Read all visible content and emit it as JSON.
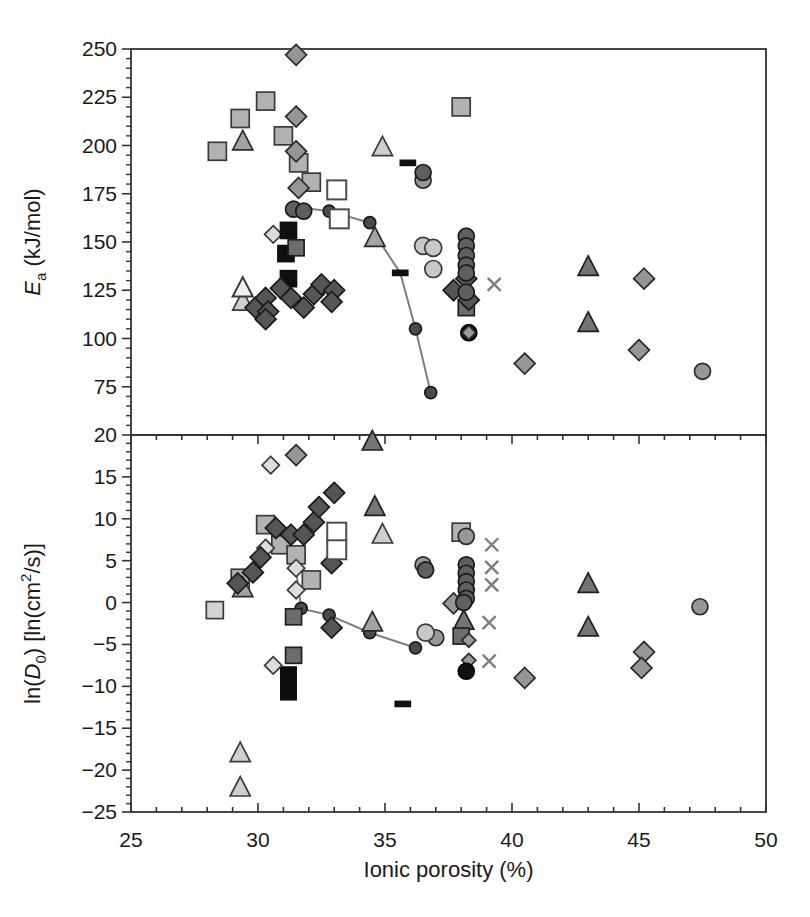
{
  "figure_bg": "#ffffff",
  "frame_color": "#333333",
  "tick_color": "#333333",
  "text_color": "#1a1a1a",
  "curve_color": "#7f7f7f",
  "layout": {
    "width": 810,
    "height": 917,
    "plot_left": 131,
    "plot_right": 766,
    "plot_top": 49,
    "plot_mid": 435,
    "plot_bottom": 812,
    "tick_font_px": 21,
    "axis_font_px": 22
  },
  "x_axis": {
    "label": "Ionic porosity (%)",
    "min": 25,
    "max": 50,
    "major_ticks": [
      25,
      30,
      35,
      40,
      45,
      50
    ],
    "tick_labels": [
      "25",
      "30",
      "35",
      "40",
      "45",
      "50"
    ],
    "minor_step": 1
  },
  "marker_styles": {
    "square_gray": {
      "shape": "square",
      "fill": "#b2b2b2",
      "stroke": "#3a3a3a",
      "size": 18
    },
    "square_light": {
      "shape": "square",
      "fill": "#d4d4d4",
      "stroke": "#3a3a3a",
      "size": 17
    },
    "square_white": {
      "shape": "square",
      "fill": "#ffffff",
      "stroke": "#4d4d4d",
      "size": 19,
      "sw": 2
    },
    "square_dark": {
      "shape": "square",
      "fill": "#6d6d6d",
      "stroke": "#1f1f1f",
      "size": 16
    },
    "square_black": {
      "shape": "square",
      "fill": "#0f0f0f",
      "stroke": "#0f0f0f",
      "size": 16
    },
    "diamond_dark": {
      "shape": "diamond",
      "fill": "#555555",
      "stroke": "#1a1a1a",
      "size": 18
    },
    "diamond_gray": {
      "shape": "diamond",
      "fill": "#969696",
      "stroke": "#2a2a2a",
      "size": 18
    },
    "diamond_gray_sm": {
      "shape": "diamond",
      "fill": "#9a9a9a",
      "stroke": "#2a2a2a",
      "size": 12
    },
    "diamond_light": {
      "shape": "diamond",
      "fill": "#dddddd",
      "stroke": "#3a3a3a",
      "size": 15
    },
    "triangle_white": {
      "shape": "triangle",
      "fill": "#f1f1f1",
      "stroke": "#3a3a3a",
      "size": 18,
      "sw": 2
    },
    "triangle_light": {
      "shape": "triangle",
      "fill": "#cfcfcf",
      "stroke": "#3a3a3a",
      "size": 18
    },
    "triangle_gray": {
      "shape": "triangle",
      "fill": "#a3a3a3",
      "stroke": "#2a2a2a",
      "size": 18
    },
    "triangle_dark": {
      "shape": "triangle",
      "fill": "#757575",
      "stroke": "#1f1f1f",
      "size": 18
    },
    "circle_dark": {
      "shape": "circle",
      "fill": "#5f5f5f",
      "stroke": "#1a1a1a",
      "size": 16
    },
    "circle_gray": {
      "shape": "circle",
      "fill": "#979797",
      "stroke": "#2a2a2a",
      "size": 16
    },
    "circle_light": {
      "shape": "circle",
      "fill": "#c8c8c8",
      "stroke": "#3a3a3a",
      "size": 17
    },
    "circle_black": {
      "shape": "circle",
      "fill": "#101010",
      "stroke": "#000000",
      "size": 16
    },
    "curve_dot": {
      "shape": "circle",
      "fill": "#4a4a4a",
      "stroke": "#1a1a1a",
      "size": 12
    },
    "cross": {
      "shape": "cross",
      "fill": "none",
      "stroke": "#7e7e7e",
      "size": 13
    },
    "dash_black": {
      "shape": "dash",
      "fill": "#101010",
      "stroke": "#101010",
      "size": 15
    }
  },
  "chart_data": [
    {
      "type": "scatter",
      "panel": "top",
      "ylabel_segments": [
        {
          "t": "E",
          "i": true
        },
        {
          "t": "a",
          "sub": true
        },
        {
          "t": " (kJ/mol)"
        }
      ],
      "ylim": [
        50,
        250
      ],
      "major_ticks": [
        250,
        225,
        200,
        175,
        150,
        125,
        100,
        75
      ],
      "tick_labels": [
        "250",
        "225",
        "200",
        "175",
        "150",
        "125",
        "100",
        "75"
      ],
      "minor_step": 5,
      "curve": {
        "points": [
          [
            31.6,
            168
          ],
          [
            32.8,
            166
          ],
          [
            34.4,
            160
          ],
          [
            34.7,
            152
          ],
          [
            35.6,
            134
          ],
          [
            36.2,
            105
          ],
          [
            36.8,
            72
          ]
        ],
        "dots": [
          [
            32.8,
            166
          ],
          [
            34.4,
            160
          ],
          [
            36.2,
            105
          ],
          [
            36.8,
            72
          ]
        ]
      },
      "series": [
        {
          "marker": "square_gray",
          "points": [
            [
              28.4,
              197
            ],
            [
              29.3,
              214
            ],
            [
              30.3,
              223
            ],
            [
              31.0,
              205
            ],
            [
              31.6,
              191
            ],
            [
              32.1,
              181
            ],
            [
              38.0,
              220
            ]
          ]
        },
        {
          "marker": "diamond_gray",
          "points": [
            [
              31.5,
              247
            ],
            [
              31.5,
              215
            ],
            [
              31.5,
              197
            ],
            [
              31.6,
              178
            ],
            [
              40.5,
              87
            ],
            [
              45.2,
              131
            ],
            [
              45.0,
              94
            ]
          ]
        },
        {
          "marker": "triangle_gray",
          "points": [
            [
              29.4,
              202
            ],
            [
              34.6,
              152
            ]
          ]
        },
        {
          "marker": "triangle_light",
          "points": [
            [
              34.9,
              199
            ],
            [
              29.4,
              119
            ]
          ]
        },
        {
          "marker": "triangle_white",
          "points": [
            [
              29.4,
              126
            ]
          ]
        },
        {
          "marker": "square_white",
          "points": [
            [
              33.1,
              177
            ],
            [
              33.2,
              162
            ]
          ]
        },
        {
          "marker": "diamond_light",
          "points": [
            [
              30.6,
              154
            ]
          ]
        },
        {
          "marker": "square_black",
          "points": [
            [
              31.2,
              156
            ],
            [
              31.1,
              144
            ],
            [
              31.2,
              131
            ]
          ]
        },
        {
          "marker": "square_dark",
          "points": [
            [
              31.5,
              147
            ],
            [
              38.2,
              116
            ]
          ]
        },
        {
          "marker": "diamond_dark",
          "points": [
            [
              29.9,
              116
            ],
            [
              30.3,
              121
            ],
            [
              30.4,
              114
            ],
            [
              30.3,
              110
            ],
            [
              30.9,
              126
            ],
            [
              31.3,
              121
            ],
            [
              31.8,
              116
            ],
            [
              32.2,
              123
            ],
            [
              32.5,
              128
            ],
            [
              33.0,
              125
            ],
            [
              32.9,
              119
            ],
            [
              38.2,
              131
            ],
            [
              37.7,
              125
            ],
            [
              38.3,
              120
            ]
          ]
        },
        {
          "marker": "circle_gray",
          "points": [
            [
              36.5,
              182
            ],
            [
              47.5,
              83
            ]
          ]
        },
        {
          "marker": "circle_dark",
          "points": [
            [
              31.4,
              167
            ],
            [
              31.8,
              166
            ],
            [
              36.5,
              186
            ],
            [
              38.2,
              153
            ],
            [
              38.2,
              148
            ],
            [
              38.2,
              143
            ],
            [
              38.2,
              138
            ],
            [
              38.2,
              134
            ],
            [
              38.2,
              124
            ]
          ]
        },
        {
          "marker": "circle_light",
          "points": [
            [
              36.5,
              148
            ],
            [
              36.9,
              147
            ],
            [
              36.9,
              136
            ]
          ]
        },
        {
          "marker": "circle_black",
          "points": [
            [
              38.3,
              103
            ]
          ]
        },
        {
          "marker": "diamond_gray_sm",
          "points": [
            [
              38.3,
              103
            ]
          ]
        },
        {
          "marker": "cross",
          "points": [
            [
              39.3,
              128
            ]
          ]
        },
        {
          "marker": "triangle_dark",
          "points": [
            [
              43.0,
              137
            ],
            [
              43.0,
              108
            ]
          ]
        },
        {
          "marker": "dash_black",
          "points": [
            [
              35.9,
              191
            ],
            [
              35.6,
              134
            ]
          ]
        }
      ]
    },
    {
      "type": "scatter",
      "panel": "bottom",
      "ylabel_segments": [
        {
          "t": "ln("
        },
        {
          "t": "D",
          "i": true
        },
        {
          "t": "0",
          "sub": true
        },
        {
          "t": ") [ln(cm"
        },
        {
          "t": "2",
          "sup": true
        },
        {
          "t": "/s)]"
        }
      ],
      "ylim": [
        -25,
        20
      ],
      "major_ticks": [
        20,
        15,
        10,
        5,
        0,
        -5,
        -10,
        -15,
        -20,
        -25
      ],
      "tick_labels": [
        "20",
        "15",
        "10",
        "5",
        "0",
        "−5",
        "−10",
        "−15",
        "−20",
        "−25"
      ],
      "minor_step": 1,
      "curve": {
        "points": [
          [
            31.5,
            3.8
          ],
          [
            31.7,
            -0.7
          ],
          [
            32.8,
            -1.5
          ],
          [
            34.4,
            -3.6
          ],
          [
            36.2,
            -5.4
          ]
        ],
        "dots": [
          [
            31.7,
            -0.7
          ],
          [
            32.8,
            -1.5
          ],
          [
            34.4,
            -3.6
          ],
          [
            36.2,
            -5.4
          ]
        ]
      },
      "bars": [
        {
          "x": 31.2,
          "y_top": -7.6,
          "y_bottom": -11.7,
          "w_px": 17,
          "fill": "#0d0d0d"
        }
      ],
      "series": [
        {
          "marker": "square_light",
          "points": [
            [
              28.3,
              -0.9
            ]
          ]
        },
        {
          "marker": "square_gray",
          "points": [
            [
              29.3,
              2.9
            ],
            [
              30.3,
              9.3
            ],
            [
              30.9,
              6.9
            ],
            [
              31.5,
              5.7
            ],
            [
              32.1,
              2.7
            ],
            [
              38.0,
              8.4
            ]
          ]
        },
        {
          "marker": "triangle_gray",
          "points": [
            [
              29.4,
              1.7
            ],
            [
              34.5,
              -2.4
            ]
          ]
        },
        {
          "marker": "diamond_light",
          "points": [
            [
              30.3,
              6.5
            ],
            [
              31.5,
              4.1
            ],
            [
              31.5,
              1.5
            ],
            [
              30.5,
              16.4
            ],
            [
              30.6,
              -7.5
            ]
          ]
        },
        {
          "marker": "diamond_dark",
          "points": [
            [
              29.2,
              2.3
            ],
            [
              29.8,
              3.6
            ],
            [
              30.1,
              5.4
            ],
            [
              30.7,
              8.9
            ],
            [
              31.3,
              8.1
            ],
            [
              31.8,
              8.1
            ],
            [
              32.2,
              9.6
            ],
            [
              32.4,
              11.4
            ],
            [
              33.0,
              13.1
            ],
            [
              32.9,
              4.7
            ],
            [
              32.9,
              -3.0
            ]
          ]
        },
        {
          "marker": "diamond_gray",
          "points": [
            [
              31.5,
              17.6
            ],
            [
              37.7,
              -0.1
            ],
            [
              40.5,
              -9.0
            ],
            [
              45.2,
              -5.9
            ],
            [
              45.1,
              -7.8
            ]
          ]
        },
        {
          "marker": "square_white",
          "points": [
            [
              33.1,
              8.4
            ],
            [
              33.1,
              6.3
            ]
          ]
        },
        {
          "marker": "triangle_dark",
          "points": [
            [
              34.5,
              19.2
            ],
            [
              34.6,
              11.4
            ],
            [
              38.1,
              -2.2
            ],
            [
              43.0,
              2.2
            ],
            [
              43.0,
              -3.0
            ]
          ]
        },
        {
          "marker": "triangle_light",
          "points": [
            [
              34.9,
              8.1
            ],
            [
              29.3,
              -18.0
            ],
            [
              29.3,
              -22.1
            ]
          ]
        },
        {
          "marker": "square_dark",
          "points": [
            [
              31.4,
              -1.7
            ],
            [
              31.4,
              -6.3
            ],
            [
              38.0,
              -4.0
            ]
          ]
        },
        {
          "marker": "circle_gray",
          "points": [
            [
              36.5,
              4.5
            ],
            [
              37.0,
              -4.2
            ],
            [
              38.2,
              7.9
            ],
            [
              47.4,
              -0.5
            ]
          ]
        },
        {
          "marker": "circle_dark",
          "points": [
            [
              36.6,
              3.9
            ],
            [
              38.2,
              4.5
            ],
            [
              38.2,
              3.5
            ],
            [
              38.2,
              2.5
            ],
            [
              38.2,
              1.5
            ],
            [
              38.2,
              0.5
            ],
            [
              38.1,
              0.0
            ]
          ]
        },
        {
          "marker": "diamond_gray_sm",
          "points": [
            [
              38.3,
              -4.5
            ],
            [
              38.3,
              -6.9
            ]
          ]
        },
        {
          "marker": "circle_light",
          "points": [
            [
              36.6,
              -3.6
            ]
          ]
        },
        {
          "marker": "circle_black",
          "points": [
            [
              38.2,
              -8.2
            ]
          ]
        },
        {
          "marker": "cross",
          "points": [
            [
              39.2,
              6.9
            ],
            [
              39.2,
              4.2
            ],
            [
              39.2,
              2.1
            ],
            [
              39.1,
              -2.4
            ],
            [
              39.1,
              -7.0
            ]
          ]
        },
        {
          "marker": "dash_black",
          "points": [
            [
              35.7,
              -12.1
            ]
          ]
        }
      ]
    }
  ]
}
